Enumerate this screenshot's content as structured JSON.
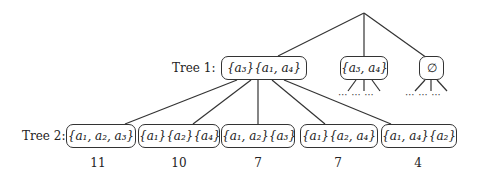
{
  "diagram": {
    "root": {
      "x": 364,
      "y": 13
    },
    "tree1": {
      "label": "Tree 1:",
      "nodes": [
        {
          "id": "t1-main",
          "text": "{a₃}{a₁, a₄}",
          "x": 221,
          "y": 56,
          "w": 86
        },
        {
          "id": "t1-a3a4",
          "text": "{a₃, a₄}",
          "x": 340,
          "y": 56,
          "w": 48
        },
        {
          "id": "t1-empty",
          "text": "∅",
          "x": 419,
          "y": 56,
          "w": 25
        }
      ],
      "ellipsis": "⋯"
    },
    "tree2": {
      "label": "Tree 2:",
      "nodes": [
        {
          "text": "{a₁, a₂, a₃}",
          "x": 66,
          "w": 70,
          "count": "11"
        },
        {
          "text": "{a₁}{a₂}{a₄}",
          "x": 138,
          "w": 82,
          "count": "10"
        },
        {
          "text": "{a₁, a₂}{a₃}",
          "x": 221,
          "w": 74,
          "count": "7"
        },
        {
          "text": "{a₁}{a₂, a₄}",
          "x": 300,
          "w": 78,
          "count": "7"
        },
        {
          "text": "{a₁, a₄}{a₂}",
          "x": 381,
          "w": 76,
          "count": "4"
        }
      ]
    }
  }
}
